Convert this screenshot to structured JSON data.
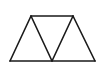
{
  "diagram": {
    "type": "geometric-figure",
    "background": "#ffffff",
    "stroke_color": "#1a1a1a",
    "stroke_width": 1.6,
    "vertices": {
      "top_left": [
        31,
        16
      ],
      "top_right": [
        73,
        16
      ],
      "bottom_left": [
        10,
        61
      ],
      "bottom_middle": [
        52,
        61
      ],
      "bottom_right": [
        95,
        61
      ]
    },
    "segments": [
      {
        "name": "top-edge",
        "from": "top_left",
        "to": "top_right"
      },
      {
        "name": "bottom-edge",
        "from": "bottom_left",
        "to": "bottom_right"
      },
      {
        "name": "left-edge",
        "from": "bottom_left",
        "to": "top_left"
      },
      {
        "name": "right-edge",
        "from": "top_right",
        "to": "bottom_right"
      },
      {
        "name": "inner-left-diagonal",
        "from": "top_left",
        "to": "bottom_middle"
      },
      {
        "name": "inner-right-diagonal",
        "from": "bottom_middle",
        "to": "top_right"
      }
    ]
  }
}
